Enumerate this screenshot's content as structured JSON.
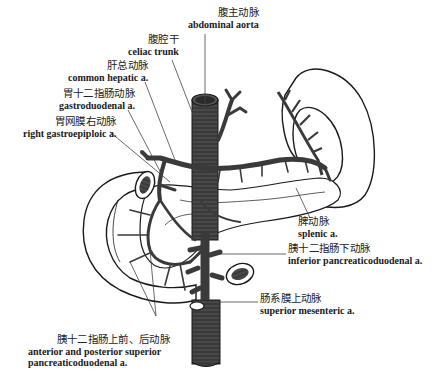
{
  "figure": {
    "colors": {
      "background": "#ffffff",
      "vessel": "#3a3a3a",
      "outline": "#1a1a1a",
      "leader_line": "#444444"
    }
  },
  "labels": [
    {
      "id": "abdominal-aorta",
      "zh": "腹主动脉",
      "en": "abdominal aorta"
    },
    {
      "id": "celiac-trunk",
      "zh": "腹腔干",
      "en": "celiac trunk"
    },
    {
      "id": "common-hepatic",
      "zh": "肝总动脉",
      "en": "common hepatic a."
    },
    {
      "id": "gastroduodenal",
      "zh": "胃十二指肠动脉",
      "en": "gastroduodenal a."
    },
    {
      "id": "right-gastroepiploic",
      "zh": "胃网膜右动脉",
      "en": "right gastroepiploic a."
    },
    {
      "id": "splenic",
      "zh": "脾动脉",
      "en": "splenic a."
    },
    {
      "id": "inferior-pancreaticoduodenal",
      "zh": "胰十二指肠下动脉",
      "en": "inferior pancreaticoduodenal a."
    },
    {
      "id": "superior-mesenteric",
      "zh": "肠系膜上动脉",
      "en": "superior mesenteric a."
    },
    {
      "id": "ant-post-superior-pancreaticoduodenal",
      "zh": "胰十二指肠上前、后动脉",
      "en_line1": "anterior and posterior superior",
      "en_line2": "pancreaticoduodenal a."
    }
  ]
}
